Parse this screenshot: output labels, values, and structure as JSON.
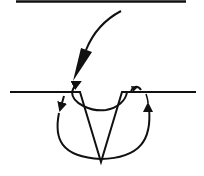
{
  "diagram": {
    "type": "line-drawing",
    "colors": {
      "stroke": "#111111",
      "background": "#ffffff"
    },
    "elements": [
      "top-horizontal-line",
      "incoming-curved-arrow",
      "surface-line-left",
      "surface-line-right",
      "v-notch",
      "inner-arc-arrow",
      "outer-loop-left-arrow",
      "outer-loop-right-arrow"
    ]
  }
}
